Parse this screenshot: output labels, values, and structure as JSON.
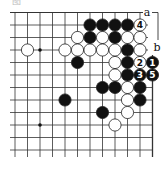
{
  "caption": "图",
  "board": {
    "grid": {
      "x_start": 10,
      "x_end": 152.5,
      "y_start": 12.5,
      "y_end": 157,
      "columns_x": [
        15,
        27.5,
        40,
        52.5,
        65,
        77.5,
        90,
        102.5,
        115,
        127.5,
        140,
        152.5
      ],
      "rows_y": [
        12.5,
        25,
        37.5,
        50,
        62.5,
        75,
        87.5,
        100,
        112.5,
        125,
        137.5,
        150
      ],
      "line_color": "#333333",
      "right_edge_x": 152.5
    },
    "star_points": [
      {
        "c": 2,
        "r": 3
      },
      {
        "c": 2,
        "r": 9
      }
    ],
    "stones": [
      {
        "c": 6,
        "r": 1,
        "color": "black"
      },
      {
        "c": 7,
        "r": 1,
        "color": "black"
      },
      {
        "c": 8,
        "r": 1,
        "color": "black"
      },
      {
        "c": 9,
        "r": 1,
        "color": "black"
      },
      {
        "c": 10,
        "r": 1,
        "color": "white",
        "label": "4"
      },
      {
        "c": 5,
        "r": 2,
        "color": "white"
      },
      {
        "c": 6,
        "r": 2,
        "color": "black"
      },
      {
        "c": 7,
        "r": 2,
        "color": "white"
      },
      {
        "c": 8,
        "r": 2,
        "color": "black"
      },
      {
        "c": 9,
        "r": 2,
        "color": "white"
      },
      {
        "c": 10,
        "r": 2,
        "color": "white"
      },
      {
        "c": 1,
        "r": 3,
        "color": "white"
      },
      {
        "c": 4,
        "r": 3,
        "color": "white"
      },
      {
        "c": 5,
        "r": 3,
        "color": "white"
      },
      {
        "c": 6,
        "r": 3,
        "color": "white"
      },
      {
        "c": 7,
        "r": 3,
        "color": "white"
      },
      {
        "c": 8,
        "r": 3,
        "color": "white"
      },
      {
        "c": 9,
        "r": 3,
        "color": "black"
      },
      {
        "c": 10,
        "r": 3,
        "color": "white"
      },
      {
        "c": 5,
        "r": 4,
        "color": "black"
      },
      {
        "c": 8,
        "r": 4,
        "color": "white"
      },
      {
        "c": 9,
        "r": 4,
        "color": "black"
      },
      {
        "c": 10,
        "r": 4,
        "color": "white",
        "label": "2"
      },
      {
        "c": 11,
        "r": 4,
        "color": "black",
        "label": "1"
      },
      {
        "c": 8,
        "r": 5,
        "color": "white"
      },
      {
        "c": 9,
        "r": 5,
        "color": "black"
      },
      {
        "c": 10,
        "r": 5,
        "color": "black",
        "label": "3"
      },
      {
        "c": 11,
        "r": 5,
        "color": "black",
        "label": "5"
      },
      {
        "c": 7,
        "r": 6,
        "color": "black"
      },
      {
        "c": 8,
        "r": 6,
        "color": "black"
      },
      {
        "c": 9,
        "r": 6,
        "color": "white"
      },
      {
        "c": 10,
        "r": 6,
        "color": "black"
      },
      {
        "c": 4,
        "r": 7,
        "color": "black"
      },
      {
        "c": 9,
        "r": 7,
        "color": "white"
      },
      {
        "c": 10,
        "r": 7,
        "color": "black"
      },
      {
        "c": 7,
        "r": 8,
        "color": "black"
      },
      {
        "c": 9,
        "r": 8,
        "color": "white"
      },
      {
        "c": 8,
        "r": 9,
        "color": "white"
      }
    ],
    "markers": [
      {
        "text": "a",
        "x": 147,
        "y": 12.5
      },
      {
        "text": "b",
        "x": 157,
        "y": 47
      }
    ],
    "bracket": {
      "from": "a",
      "to": "b"
    }
  }
}
